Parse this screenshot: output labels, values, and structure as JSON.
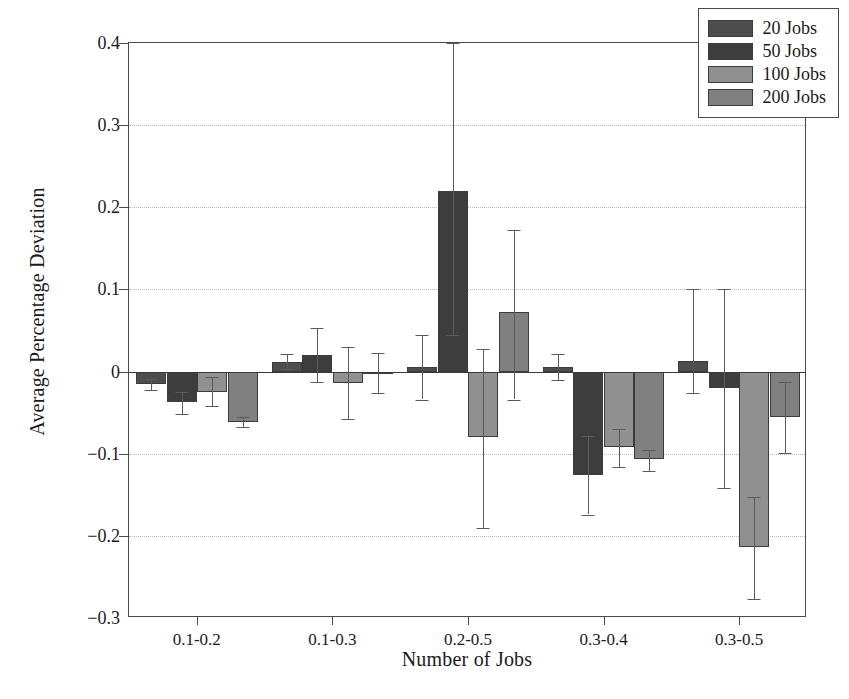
{
  "chart_data": {
    "type": "bar",
    "title": "",
    "xlabel": "Number of Jobs",
    "ylabel": "Average Percentage Deviation",
    "categories": [
      "0.1-0.2",
      "0.1-0.3",
      "0.2-0.5",
      "0.3-0.4",
      "0.3-0.5"
    ],
    "ylim": [
      -0.3,
      0.4
    ],
    "yticks": [
      -0.3,
      -0.2,
      -0.1,
      0,
      0.1,
      0.2,
      0.3,
      0.4
    ],
    "ytick_labels": [
      "−0.3",
      "−0.2",
      "−0.1",
      "0",
      "0.1",
      "0.2",
      "0.3",
      "0.4"
    ],
    "grid": "horizontal-dotted",
    "legend_position": "top-right",
    "series": [
      {
        "name": "20 Jobs",
        "color": "#4d4d4d",
        "values": [
          -0.015,
          0.012,
          0.005,
          0.006,
          0.013
        ],
        "err_low": [
          -0.022,
          0.003,
          -0.034,
          -0.01,
          -0.026
        ],
        "err_high": [
          -0.009,
          0.022,
          0.044,
          0.022,
          0.101
        ]
      },
      {
        "name": "50 Jobs",
        "color": "#3d3d3d",
        "values": [
          -0.037,
          0.02,
          0.22,
          -0.126,
          -0.02
        ],
        "err_low": [
          -0.052,
          -0.013,
          0.044,
          -0.174,
          -0.142
        ],
        "err_high": [
          -0.025,
          0.053,
          0.4,
          -0.079,
          0.1
        ]
      },
      {
        "name": "100 Jobs",
        "color": "#909090",
        "values": [
          -0.025,
          -0.014,
          -0.08,
          -0.092,
          -0.214
        ],
        "err_low": [
          -0.042,
          -0.058,
          -0.19,
          -0.116,
          -0.277
        ],
        "err_high": [
          -0.007,
          0.03,
          0.027,
          -0.07,
          -0.153
        ]
      },
      {
        "name": "200 Jobs",
        "color": "#808080",
        "values": [
          -0.062,
          0.0,
          0.073,
          -0.107,
          -0.055
        ]
      }
    ],
    "series_200_err_low": [
      -0.068,
      -0.026,
      -0.034,
      -0.121,
      -0.099
    ],
    "series_200_err_high": [
      -0.055,
      0.023,
      0.172,
      -0.096,
      -0.013
    ]
  },
  "legend": {
    "items": [
      {
        "label": "20 Jobs"
      },
      {
        "label": "50 Jobs"
      },
      {
        "label": "100 Jobs"
      },
      {
        "label": "200 Jobs"
      }
    ]
  },
  "axes": {
    "x_title": "Number of Jobs",
    "y_title": "Average Percentage Deviation"
  }
}
